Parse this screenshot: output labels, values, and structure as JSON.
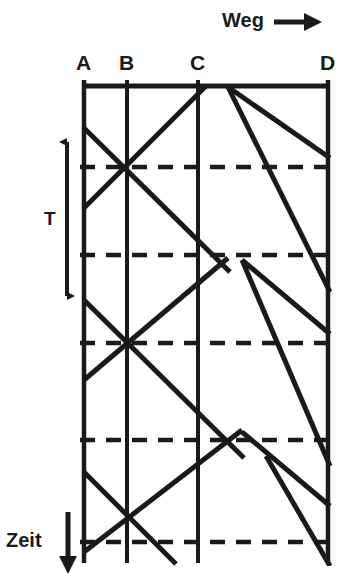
{
  "diagram": {
    "title_axis_horizontal": "Weg",
    "title_axis_vertical": "Zeit",
    "period_label": "T",
    "stations": [
      {
        "label": "A",
        "x": 84
      },
      {
        "label": "B",
        "x": 127
      },
      {
        "label": "C",
        "x": 198
      },
      {
        "label": "D",
        "x": 328
      }
    ],
    "time_grid_lines": [
      167,
      255,
      343,
      440,
      542
    ],
    "frame": {
      "top": 86,
      "bottom": 563
    },
    "period_arrow": {
      "x": 67,
      "y_top": 140,
      "y_bottom": 297
    },
    "zeit_arrow": {
      "x": 68,
      "y_top": 510,
      "y_bottom": 568
    },
    "weg_arrow": {
      "x_start": 278,
      "x_end": 322,
      "y": 22
    },
    "stroke_color": "#1a1a1a",
    "train_paths": [
      {
        "name": "down-train-1",
        "points": "84,128 198,240 228,268"
      },
      {
        "name": "up-train-1",
        "points": "84,205 198,98 215,86"
      },
      {
        "name": "down-train-2",
        "points": "228,87 328,155"
      },
      {
        "name": "up-train-2",
        "points": "328,290 228,87"
      },
      {
        "name": "down-train-3",
        "points": "84,300 198,412 240,448"
      },
      {
        "name": "up-train-3",
        "points": "84,377 198,270 228,258"
      },
      {
        "name": "down-train-4",
        "points": "240,258 328,330"
      },
      {
        "name": "up-train-4",
        "points": "328,462 240,258"
      },
      {
        "name": "down-train-5",
        "points": "84,472 198,578"
      },
      {
        "name": "up-train-5",
        "points": "84,548 198,442 240,430"
      },
      {
        "name": "down-train-6",
        "points": "240,430 328,502"
      },
      {
        "name": "up-train-6",
        "points": "328,578 262,452"
      }
    ]
  }
}
